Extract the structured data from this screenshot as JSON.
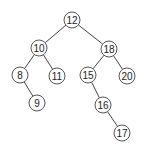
{
  "diagram": {
    "type": "binary-search-tree",
    "style": {
      "background": "#ffffff",
      "edge_color": "#444444",
      "node_stroke": "#555555",
      "node_fill": "#ffffff",
      "text_color": "#222222",
      "node_radius": 8
    },
    "nodes": [
      {
        "id": "n12",
        "label": "12",
        "x": 72,
        "y": 20
      },
      {
        "id": "n10",
        "label": "10",
        "x": 39,
        "y": 48
      },
      {
        "id": "n18",
        "label": "18",
        "x": 109,
        "y": 49
      },
      {
        "id": "n8",
        "label": "8",
        "x": 20,
        "y": 75
      },
      {
        "id": "n11",
        "label": "11",
        "x": 57,
        "y": 76
      },
      {
        "id": "n15",
        "label": "15",
        "x": 88,
        "y": 75
      },
      {
        "id": "n20",
        "label": "20",
        "x": 127,
        "y": 76
      },
      {
        "id": "n9",
        "label": "9",
        "x": 37,
        "y": 103
      },
      {
        "id": "n16",
        "label": "16",
        "x": 103,
        "y": 105
      },
      {
        "id": "n17",
        "label": "17",
        "x": 122,
        "y": 133
      }
    ],
    "edges": [
      {
        "from": "n12",
        "to": "n10"
      },
      {
        "from": "n12",
        "to": "n18"
      },
      {
        "from": "n10",
        "to": "n8"
      },
      {
        "from": "n10",
        "to": "n11"
      },
      {
        "from": "n18",
        "to": "n15"
      },
      {
        "from": "n18",
        "to": "n20"
      },
      {
        "from": "n8",
        "to": "n9"
      },
      {
        "from": "n15",
        "to": "n16"
      },
      {
        "from": "n16",
        "to": "n17"
      }
    ]
  }
}
